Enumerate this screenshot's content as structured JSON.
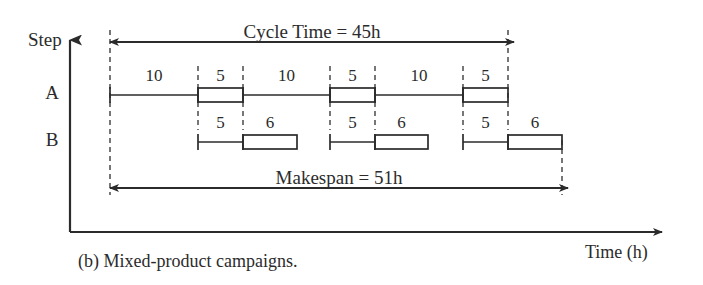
{
  "figure": {
    "caption": "(b) Mixed-product campaigns.",
    "axis": {
      "y_label": "Step",
      "x_label": "Time (h)",
      "origin_x": 70,
      "origin_y": 232,
      "y_top": 40,
      "x_right": 662
    },
    "rows": [
      {
        "id": "A",
        "label": "A",
        "y": 95
      },
      {
        "id": "B",
        "label": "B",
        "y": 142
      }
    ],
    "spans": [
      {
        "name": "cycle-time",
        "label": "Cycle Time = 45h",
        "value": 45,
        "unit": "h",
        "y": 42,
        "x_start": 110,
        "x_end": 514,
        "label_x": 312,
        "label_y": 22
      },
      {
        "name": "makespan",
        "label": "Makespan = 51h",
        "value": 51,
        "unit": "h",
        "y": 188,
        "x_start": 110,
        "x_end": 568,
        "label_x": 339,
        "label_y": 168
      }
    ],
    "guides": [
      {
        "name": "guide-origin",
        "x": 110,
        "y1": 30,
        "y2": 195
      },
      {
        "name": "guide-a1-start",
        "x": 198,
        "y1": 66,
        "y2": 130
      },
      {
        "name": "guide-a1-end",
        "x": 243,
        "y1": 66,
        "y2": 130
      },
      {
        "name": "guide-a2-start",
        "x": 330,
        "y1": 66,
        "y2": 130
      },
      {
        "name": "guide-a2-end",
        "x": 375,
        "y1": 66,
        "y2": 130
      },
      {
        "name": "guide-a3-start",
        "x": 463,
        "y1": 66,
        "y2": 130
      },
      {
        "name": "guide-cycle-end",
        "x": 508,
        "y1": 30,
        "y2": 130
      },
      {
        "name": "guide-makespan-end",
        "x": 562,
        "y1": 140,
        "y2": 195
      }
    ],
    "tasks": [
      {
        "row": "A",
        "type": "line",
        "label": "10",
        "duration": 10,
        "x_start": 110,
        "x_end": 198,
        "name": "task-a-transfer-1"
      },
      {
        "row": "A",
        "type": "box",
        "label": "5",
        "duration": 5,
        "x_start": 198,
        "x_end": 243,
        "name": "task-a-batch-1"
      },
      {
        "row": "A",
        "type": "line",
        "label": "10",
        "duration": 10,
        "x_start": 243,
        "x_end": 330,
        "name": "task-a-transfer-2"
      },
      {
        "row": "A",
        "type": "box",
        "label": "5",
        "duration": 5,
        "x_start": 330,
        "x_end": 375,
        "name": "task-a-batch-2"
      },
      {
        "row": "A",
        "type": "line",
        "label": "10",
        "duration": 10,
        "x_start": 375,
        "x_end": 463,
        "name": "task-a-transfer-3"
      },
      {
        "row": "A",
        "type": "box",
        "label": "5",
        "duration": 5,
        "x_start": 463,
        "x_end": 508,
        "name": "task-a-batch-3"
      },
      {
        "row": "B",
        "type": "line",
        "label": "5",
        "duration": 5,
        "x_start": 198,
        "x_end": 243,
        "name": "task-b-transfer-1"
      },
      {
        "row": "B",
        "type": "box",
        "label": "6",
        "duration": 6,
        "x_start": 243,
        "x_end": 297,
        "name": "task-b-batch-1"
      },
      {
        "row": "B",
        "type": "line",
        "label": "5",
        "duration": 5,
        "x_start": 330,
        "x_end": 375,
        "name": "task-b-transfer-2"
      },
      {
        "row": "B",
        "type": "box",
        "label": "6",
        "duration": 6,
        "x_start": 375,
        "x_end": 428,
        "name": "task-b-batch-2"
      },
      {
        "row": "B",
        "type": "line",
        "label": "5",
        "duration": 5,
        "x_start": 463,
        "x_end": 508,
        "name": "task-b-transfer-3"
      },
      {
        "row": "B",
        "type": "box",
        "label": "6",
        "duration": 6,
        "x_start": 508,
        "x_end": 562,
        "name": "task-b-batch-3"
      }
    ],
    "colors": {
      "ink": "#2b2b2b",
      "background": "#ffffff",
      "guide": "#555555"
    }
  },
  "chart_data": {
    "type": "gantt",
    "title": "(b) Mixed-product campaigns.",
    "xlabel": "Time (h)",
    "ylabel": "Step",
    "categories": [
      "A",
      "B"
    ],
    "grid": false,
    "legend": "none",
    "series": [
      {
        "name": "A",
        "tasks": [
          {
            "label": "10",
            "duration": 10,
            "style": "line"
          },
          {
            "label": "5",
            "duration": 5,
            "style": "box"
          },
          {
            "label": "10",
            "duration": 10,
            "style": "line"
          },
          {
            "label": "5",
            "duration": 5,
            "style": "box"
          },
          {
            "label": "10",
            "duration": 10,
            "style": "line"
          },
          {
            "label": "5",
            "duration": 5,
            "style": "box"
          }
        ]
      },
      {
        "name": "B",
        "tasks": [
          {
            "label": "5",
            "duration": 5,
            "style": "line"
          },
          {
            "label": "6",
            "duration": 6,
            "style": "box"
          },
          {
            "label": "5",
            "duration": 5,
            "style": "line"
          },
          {
            "label": "6",
            "duration": 6,
            "style": "box"
          },
          {
            "label": "5",
            "duration": 5,
            "style": "line"
          },
          {
            "label": "6",
            "duration": 6,
            "style": "box"
          }
        ]
      }
    ],
    "annotations": [
      {
        "label": "Cycle Time = 45h",
        "value": 45,
        "unit": "h"
      },
      {
        "label": "Makespan = 51h",
        "value": 51,
        "unit": "h"
      }
    ]
  }
}
